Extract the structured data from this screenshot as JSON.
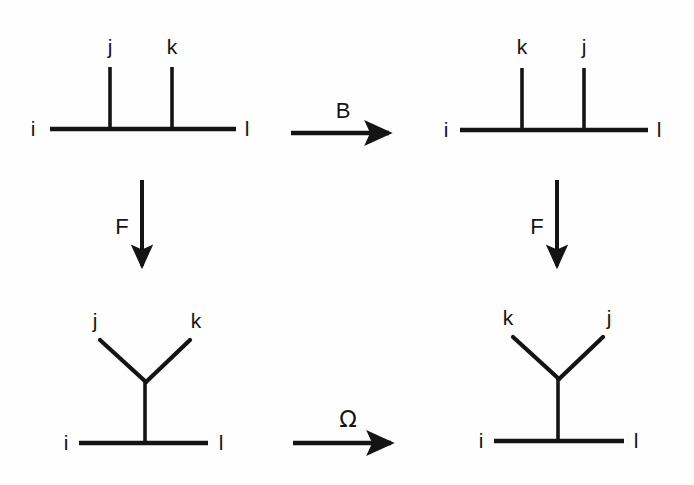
{
  "figure": {
    "type": "commutative-diagram",
    "background_color": "#fefefe",
    "stroke_color": "#141414"
  },
  "diagrams": {
    "top_left": {
      "name": "tree-comb-jk",
      "labels": {
        "left_leg": "i",
        "right_leg": "l",
        "inner_leg_1": "j",
        "inner_leg_2": "k"
      },
      "geometry": {
        "baseline_y": 129,
        "baseline_x1": 50,
        "baseline_x2": 236,
        "leg1_x": 110,
        "leg2_x": 172,
        "leg_top_y": 67,
        "label_i": {
          "x": 33,
          "y": 128
        },
        "label_l": {
          "x": 247,
          "y": 128
        },
        "label_1": {
          "x": 110,
          "y": 46
        },
        "label_2": {
          "x": 172,
          "y": 46
        }
      }
    },
    "top_right": {
      "name": "tree-comb-kj",
      "labels": {
        "left_leg": "i",
        "right_leg": "l",
        "inner_leg_1": "k",
        "inner_leg_2": "j"
      },
      "geometry": {
        "baseline_y": 130,
        "baseline_x1": 460,
        "baseline_x2": 648,
        "leg1_x": 522,
        "leg2_x": 584,
        "leg_top_y": 68,
        "label_i": {
          "x": 446,
          "y": 129
        },
        "label_l": {
          "x": 659,
          "y": 129
        },
        "label_1": {
          "x": 522,
          "y": 46
        },
        "label_2": {
          "x": 584,
          "y": 46
        }
      }
    },
    "bottom_left": {
      "name": "tree-fork-jk",
      "labels": {
        "left_leg": "i",
        "right_leg": "l",
        "fork_left": "j",
        "fork_right": "k"
      },
      "geometry": {
        "baseline_y": 443,
        "baseline_x1": 79,
        "baseline_x2": 208,
        "stem_x": 145,
        "vertex_y": 382,
        "fork_left_x": 100,
        "fork_right_x": 190,
        "fork_top_y": 340,
        "label_i": {
          "x": 66,
          "y": 442
        },
        "label_l": {
          "x": 221,
          "y": 442
        },
        "label_fl": {
          "x": 95,
          "y": 320
        },
        "label_fr": {
          "x": 196,
          "y": 320
        }
      }
    },
    "bottom_right": {
      "name": "tree-fork-kj",
      "labels": {
        "left_leg": "i",
        "right_leg": "l",
        "fork_left": "k",
        "fork_right": "j"
      },
      "geometry": {
        "baseline_y": 441,
        "baseline_x1": 494,
        "baseline_x2": 624,
        "stem_x": 558,
        "vertex_y": 379,
        "fork_left_x": 513,
        "fork_right_x": 603,
        "fork_top_y": 337,
        "label_i": {
          "x": 481,
          "y": 440
        },
        "label_l": {
          "x": 636,
          "y": 440
        },
        "label_fl": {
          "x": 508,
          "y": 317
        },
        "label_fr": {
          "x": 609,
          "y": 317
        }
      }
    }
  },
  "arrows": {
    "top": {
      "name": "arrow-b",
      "label": "B",
      "direction": "right",
      "geometry": {
        "x1": 291,
        "x2": 398,
        "y": 133,
        "label_x": 343,
        "label_y": 110
      }
    },
    "left": {
      "name": "arrow-f-left",
      "label": "F",
      "direction": "down",
      "geometry": {
        "x": 142,
        "y1": 180,
        "y2": 275,
        "label_x": 122,
        "label_y": 226
      }
    },
    "right": {
      "name": "arrow-f-right",
      "label": "F",
      "direction": "down",
      "geometry": {
        "x": 557,
        "y1": 180,
        "y2": 275,
        "label_x": 537,
        "label_y": 226
      }
    },
    "bottom": {
      "name": "arrow-omega",
      "label": "Ω",
      "direction": "right",
      "geometry": {
        "x1": 293,
        "x2": 400,
        "y": 443,
        "label_x": 348,
        "label_y": 419
      }
    }
  }
}
